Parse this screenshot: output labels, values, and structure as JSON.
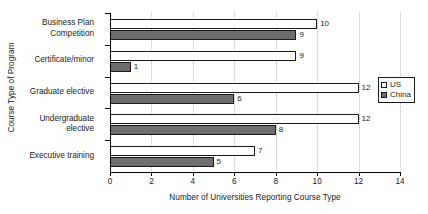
{
  "chart_data": {
    "type": "bar",
    "orientation": "horizontal",
    "title": "",
    "xlabel": "Number of Universities Reporting Course Type",
    "ylabel": "Course Type of Program",
    "categories": [
      "Business Plan Competition",
      "Certificate/minor",
      "Graduate elective",
      "Undergraduate elective",
      "Executive training"
    ],
    "category_lines": [
      [
        "Business Plan",
        "Competition"
      ],
      [
        "Certificate/minor"
      ],
      [
        "Graduate elective"
      ],
      [
        "Undergraduate",
        "elective"
      ],
      [
        "Executive training"
      ]
    ],
    "series": [
      {
        "name": "US",
        "color": "#ffffff",
        "values": [
          10,
          9,
          12,
          12,
          7
        ]
      },
      {
        "name": "China",
        "color": "#6e6e6e",
        "values": [
          9,
          1,
          6,
          8,
          5
        ]
      }
    ],
    "xlim": [
      0,
      14
    ],
    "xticks": [
      0,
      2,
      4,
      6,
      8,
      10,
      12,
      14
    ],
    "xtick_labels": [
      "0",
      "2",
      "4",
      "6",
      "8",
      "10",
      "12",
      "14"
    ],
    "grid": "vertical-dotted",
    "data_labels": true,
    "legend_position": "right",
    "legend": [
      {
        "label": "US",
        "swatch": "us"
      },
      {
        "label": "China",
        "swatch": "china"
      }
    ]
  }
}
